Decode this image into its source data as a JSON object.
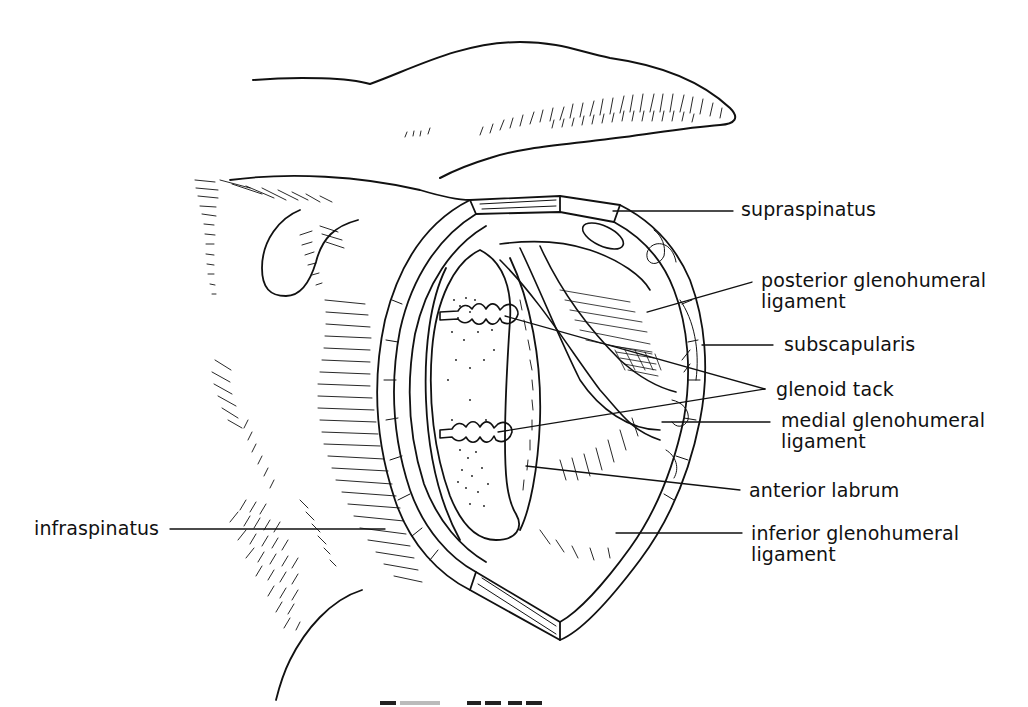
{
  "figure": {
    "colors": {
      "ink": "#111111",
      "background": "#ffffff"
    }
  },
  "labels": {
    "supraspinatus": "supraspinatus",
    "posterior_glenohumeral_ligament": [
      "posterior glenohumeral",
      "ligament"
    ],
    "subscapularis": "subscapularis",
    "glenoid_tack": "glenoid tack",
    "medial_glenohumeral_ligament": [
      "medial glenohumeral",
      "ligament"
    ],
    "anterior_labrum": "anterior labrum",
    "inferior_glenohumeral_ligament": [
      "inferior glenohumeral",
      "ligament"
    ],
    "infraspinatus": "infraspinatus"
  }
}
